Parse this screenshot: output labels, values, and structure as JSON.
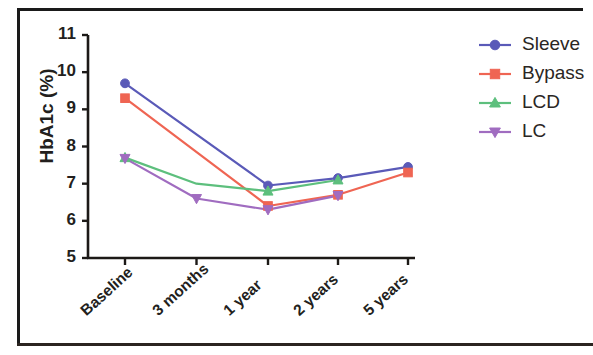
{
  "chart_data": {
    "type": "line",
    "title": "",
    "xlabel": "",
    "ylabel": "HbA1c (%)",
    "categories": [
      "Baseline",
      "3 months",
      "1 year",
      "2 years",
      "5 years"
    ],
    "ylim": [
      5,
      11
    ],
    "ytick_labels": [
      "11",
      "10",
      "9",
      "8",
      "7",
      "6",
      "5"
    ],
    "ytick_values": [
      11,
      10,
      9,
      8,
      7,
      6,
      5
    ],
    "grid": false,
    "legend_position": "right",
    "series": [
      {
        "name": "Sleeve",
        "color": "#5a5ab8",
        "marker": "circle",
        "x": [
          "Baseline",
          "3 months",
          "1 year",
          "2 years",
          "5 years"
        ],
        "values": [
          9.7,
          null,
          6.95,
          7.15,
          7.45
        ],
        "marker_points": [
          {
            "x": "Baseline",
            "y": 9.7
          },
          {
            "x": "1 year",
            "y": 6.95
          },
          {
            "x": "2 years",
            "y": 7.15
          },
          {
            "x": "5 years",
            "y": 7.45
          }
        ]
      },
      {
        "name": "Bypass",
        "color": "#ef6553",
        "marker": "square",
        "x": [
          "Baseline",
          "3 months",
          "1 year",
          "2 years",
          "5 years"
        ],
        "values": [
          9.3,
          null,
          6.4,
          6.7,
          7.3
        ],
        "marker_points": [
          {
            "x": "Baseline",
            "y": 9.3
          },
          {
            "x": "1 year",
            "y": 6.4
          },
          {
            "x": "2 years",
            "y": 6.7
          },
          {
            "x": "5 years",
            "y": 7.3
          }
        ]
      },
      {
        "name": "LCD",
        "color": "#5dbf7d",
        "marker": "triangle-up",
        "x": [
          "Baseline",
          "3 months",
          "1 year",
          "2 years"
        ],
        "values": [
          7.7,
          7.0,
          6.8,
          7.1
        ],
        "marker_points": [
          {
            "x": "Baseline",
            "y": 7.7
          },
          {
            "x": "1 year",
            "y": 6.8
          },
          {
            "x": "2 years",
            "y": 7.1
          }
        ]
      },
      {
        "name": "LC",
        "color": "#a06cc0",
        "marker": "triangle-down",
        "x": [
          "Baseline",
          "3 months",
          "1 year",
          "2 years"
        ],
        "values": [
          7.68,
          6.6,
          6.3,
          6.68
        ],
        "marker_points": [
          {
            "x": "Baseline",
            "y": 7.68
          },
          {
            "x": "3 months",
            "y": 6.6
          },
          {
            "x": "1 year",
            "y": 6.3
          },
          {
            "x": "2 years",
            "y": 6.68
          }
        ]
      }
    ]
  },
  "legend": {
    "items": [
      {
        "label": "Sleeve"
      },
      {
        "label": "Bypass"
      },
      {
        "label": "LCD"
      },
      {
        "label": "LC"
      }
    ]
  },
  "axis": {
    "y_title": "HbA1c (%)"
  }
}
